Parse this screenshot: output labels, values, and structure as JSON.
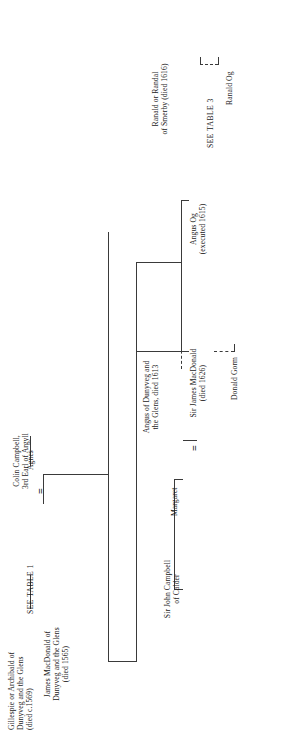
{
  "document": {
    "type": "genealogical-chart",
    "orientation": "rotated-90-ccw",
    "line_color": "#3a3a3a",
    "text_color": "#1a1a1a",
    "background": "#ffffff"
  },
  "nodes": {
    "root": {
      "name": "Gillespie or Archibald of",
      "line2": "Dunyveg and the Glens",
      "line3": "(died c.1569)"
    },
    "see_table_1": {
      "label": "SEE TABLE 1"
    },
    "james_macdonald": {
      "line1": "James MacDonald of",
      "line2": "Dunyveg and the Glens",
      "line3": "(died 1565)"
    },
    "colin_campbell": {
      "line1": "Colin Campbell,",
      "line2": "3rd Earl of Argyll"
    },
    "agnes": {
      "label": "Agnes"
    },
    "marriage_1": {
      "symbol": "="
    },
    "angus_dunyveg": {
      "line1": "Angus of Dunyveg and",
      "line2": "the Glens, died 1613"
    },
    "ranald_smerby": {
      "line1": "Ranald or Randal",
      "line2": "of Smerby (died 1616)"
    },
    "see_table_3": {
      "label": "SEE TABLE 3"
    },
    "ranald_og": {
      "label": "Ranald Og"
    },
    "angus_og": {
      "line1": "Angus Og",
      "line2": "(executed 1615)"
    },
    "sir_james_macdonald": {
      "line1": "Sir James MacDonald",
      "line2": "(died 1626)"
    },
    "donald_gorm": {
      "label": "Donald Gorm"
    },
    "margaret": {
      "label": "Margaret"
    },
    "marriage_2": {
      "symbol": "="
    },
    "sir_john_campbell": {
      "line1": "Sir John Campbell",
      "line2": "of Calder"
    }
  }
}
